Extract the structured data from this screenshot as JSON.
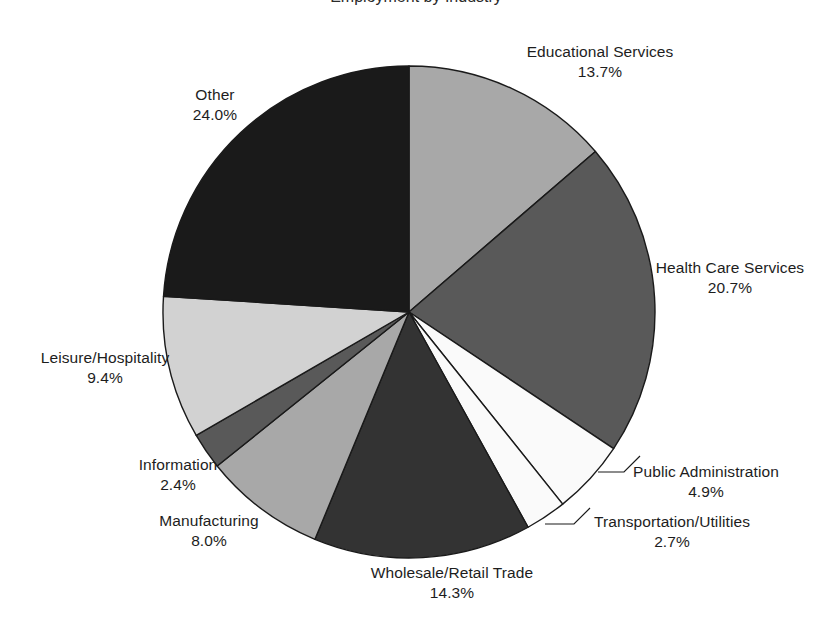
{
  "title": {
    "text": "Employment by Industry",
    "visible_fragment": true,
    "note": "cropped at top edge of image"
  },
  "chart_data": {
    "type": "pie",
    "title": "Employment by Industry",
    "xlabel": "",
    "ylabel": "",
    "start_angle_deg": 0,
    "direction": "clockwise",
    "legend": "none",
    "grid": false,
    "labels_show_percent": true,
    "categories": [
      "Educational Services",
      "Health Care Services",
      "Public Administration",
      "Transportation/Utilities",
      "Wholesale/Retail Trade",
      "Manufacturing",
      "Information",
      "Leisure/Hospitality",
      "Other"
    ],
    "values": [
      13.7,
      20.7,
      4.9,
      2.7,
      14.3,
      8.0,
      2.4,
      9.4,
      24.0
    ],
    "value_labels": [
      "13.7%",
      "20.7%",
      "4.9%",
      "2.7%",
      "14.3%",
      "8.0%",
      "2.4%",
      "9.4%",
      "24.0%"
    ],
    "colors": [
      "#a8a8a8",
      "#595959",
      "#fafafa",
      "#fafafa",
      "#333333",
      "#a8a8a8",
      "#595959",
      "#d2d2d2",
      "#1a1a1a"
    ],
    "slice_outline_color": "#1a1a1a",
    "total": 100.1
  },
  "slices": [
    {
      "name": "Educational Services",
      "percent_label": "13.7%",
      "value": 13.7,
      "color": "#a8a8a8",
      "label_x": 600,
      "label_y": 42,
      "leader": false,
      "align": "center"
    },
    {
      "name": "Health Care Services",
      "percent_label": "20.7%",
      "value": 20.7,
      "color": "#595959",
      "label_x": 730,
      "label_y": 258,
      "leader": false,
      "align": "center"
    },
    {
      "name": "Public Administration",
      "percent_label": "4.9%",
      "value": 4.9,
      "color": "#fafafa",
      "label_x": 706,
      "label_y": 462,
      "leader": true,
      "align": "center"
    },
    {
      "name": "Transportation/Utilities",
      "percent_label": "2.7%",
      "value": 2.7,
      "color": "#fafafa",
      "label_x": 672,
      "label_y": 512,
      "leader": true,
      "align": "center"
    },
    {
      "name": "Wholesale/Retail Trade",
      "percent_label": "14.3%",
      "value": 14.3,
      "color": "#333333",
      "label_x": 452,
      "label_y": 563,
      "leader": false,
      "align": "center"
    },
    {
      "name": "Manufacturing",
      "percent_label": "8.0%",
      "value": 8.0,
      "color": "#a8a8a8",
      "label_x": 209,
      "label_y": 511,
      "leader": false,
      "align": "center"
    },
    {
      "name": "Information",
      "percent_label": "2.4%",
      "value": 2.4,
      "color": "#595959",
      "label_x": 178,
      "label_y": 455,
      "leader": false,
      "align": "center"
    },
    {
      "name": "Leisure/Hospitality",
      "percent_label": "9.4%",
      "value": 9.4,
      "color": "#d2d2d2",
      "label_x": 105,
      "label_y": 348,
      "leader": false,
      "align": "center"
    },
    {
      "name": "Other",
      "percent_label": "24.0%",
      "value": 24.0,
      "color": "#1a1a1a",
      "label_x": 215,
      "label_y": 85,
      "leader": false,
      "align": "center"
    }
  ],
  "geometry": {
    "center_x": 409,
    "center_y": 312,
    "radius": 246
  },
  "leaders": [
    {
      "name": "public-administration-leader",
      "points": "598,472 624,472 640,456"
    },
    {
      "name": "transportation-utilities-leader",
      "points": "545,524 574,524 590,508"
    }
  ]
}
